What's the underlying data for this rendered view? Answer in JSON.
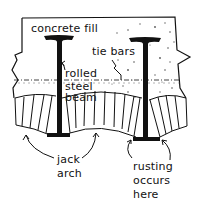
{
  "diagram": {
    "labels": {
      "concrete_fill": "concrete fill",
      "tie_bars": "tie bars",
      "rolled_steel_beam": [
        "rolled",
        "steel",
        "beam"
      ],
      "jack_arch": [
        "jack",
        "arch"
      ],
      "rusting": [
        "rusting",
        "occurs",
        "here"
      ]
    },
    "colors": {
      "ink": "#111111",
      "background": "#ffffff",
      "speckle": "#555555"
    }
  }
}
